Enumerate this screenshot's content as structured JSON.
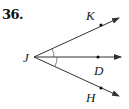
{
  "problem": {
    "number": "36."
  },
  "diagram": {
    "vertex": {
      "label": "J",
      "x": 34,
      "y": 57
    },
    "rays": [
      {
        "name": "JK",
        "label": "K",
        "point": {
          "x": 101,
          "y": 25
        },
        "tip": {
          "x": 119,
          "y": 18
        }
      },
      {
        "name": "JD",
        "label": "D",
        "point": {
          "x": 98,
          "y": 57
        },
        "tip": {
          "x": 121,
          "y": 57
        }
      },
      {
        "name": "JH",
        "label": "H",
        "point": {
          "x": 101,
          "y": 88
        },
        "tip": {
          "x": 119,
          "y": 96
        }
      }
    ],
    "angle_marks": [
      "angle KJD",
      "angle DJH"
    ],
    "colors": {
      "stroke": "#333333"
    }
  }
}
